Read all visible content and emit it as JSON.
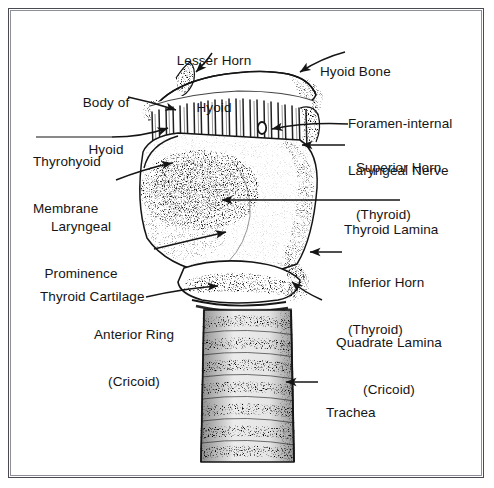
{
  "figure": {
    "type": "anatomical-line-drawing",
    "style": "black and white stippled pen-and-ink engraving",
    "background_color": "#ffffff",
    "ink_color": "#151515",
    "frame": {
      "outer_color": "#4a4a52",
      "inner_color": "#8e8e96"
    }
  },
  "labels": [
    {
      "id": "lesser-horn-hyoid",
      "line1": "Lesser Horn",
      "line2": "Hyoid",
      "side": "top"
    },
    {
      "id": "hyoid-bone",
      "line1": "Hyoid Bone",
      "line2": "",
      "side": "right"
    },
    {
      "id": "body-of-hyoid",
      "line1": "Body of",
      "line2": "Hyoid",
      "side": "left"
    },
    {
      "id": "foramen-internal-laryngeal-nerve",
      "line1": "Foramen-internal",
      "line2": "Laryngeal Nerve",
      "side": "right"
    },
    {
      "id": "thyrohyoid-membrane",
      "line1": "Thyrohyoid",
      "line2": "Membrane",
      "side": "left"
    },
    {
      "id": "superior-horn-thyroid",
      "line1": "Superior Horn",
      "line2": "(Thyroid)",
      "side": "right"
    },
    {
      "id": "laryngeal-prominence",
      "line1": "Laryngeal",
      "line2": "Prominence",
      "side": "left"
    },
    {
      "id": "thyroid-lamina",
      "line1": "Thyroid Lamina",
      "line2": "",
      "side": "right"
    },
    {
      "id": "thyroid-cartilage",
      "line1": "Thyroid Cartilage",
      "line2": "",
      "side": "left"
    },
    {
      "id": "inferior-horn-thyroid",
      "line1": "Inferior Horn",
      "line2": "(Thyroid)",
      "side": "right"
    },
    {
      "id": "anterior-ring-cricoid",
      "line1": "Anterior Ring",
      "line2": "(Cricoid)",
      "side": "left"
    },
    {
      "id": "quadrate-lamina-cricoid",
      "line1": "Quadrate Lamina",
      "line2": "(Cricoid)",
      "side": "right"
    },
    {
      "id": "trachea",
      "line1": "Trachea",
      "line2": "",
      "side": "right"
    }
  ]
}
